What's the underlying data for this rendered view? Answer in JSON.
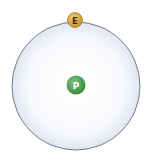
{
  "diagram": {
    "title": "",
    "nucleus": {
      "label": "P",
      "color": "#4a9a4a",
      "highlight": "#7cc37a",
      "text_color": "#ffffff"
    },
    "electron": {
      "label": "E",
      "color": "#d9a33a",
      "highlight": "#f3cf74",
      "text_color": "#3a2a10"
    },
    "orbit": {
      "fill_center": "#ffffff",
      "fill_edge": "#dfe6f2",
      "stroke": "#6f7b8c"
    }
  }
}
